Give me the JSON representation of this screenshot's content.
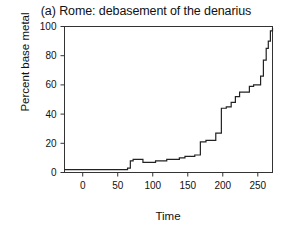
{
  "chart_data": {
    "type": "line",
    "subtype": "step",
    "title": "(a) Rome: debasement of the denarius",
    "xlabel": "Time",
    "ylabel": "Percent base metal",
    "xlim": [
      -26,
      271
    ],
    "ylim": [
      0,
      100
    ],
    "xticks": [
      0,
      50,
      100,
      150,
      200,
      250
    ],
    "yticks": [
      0,
      20,
      40,
      60,
      80,
      100
    ],
    "xtick_labels": [
      "0",
      "50",
      "100",
      "150",
      "200",
      "250"
    ],
    "ytick_labels": [
      "0",
      "20",
      "40",
      "60",
      "80",
      "100"
    ],
    "grid": false,
    "legend": null,
    "line_color": "#222222",
    "series": [
      {
        "name": "Percent base metal in the denarius",
        "x": [
          -26,
          54,
          64,
          68,
          72,
          79,
          86,
          94,
          104,
          112,
          120,
          130,
          138,
          146,
          152,
          160,
          168,
          176,
          186,
          190,
          194,
          198,
          205,
          212,
          218,
          224,
          230,
          238,
          244,
          250,
          254,
          258,
          262,
          265,
          268,
          271
        ],
        "values": [
          2,
          2,
          3,
          8,
          9,
          9,
          7,
          7,
          8,
          8,
          9,
          9,
          10,
          11,
          11,
          12,
          21,
          22,
          22,
          27,
          27,
          44,
          45,
          48,
          52,
          55,
          55,
          59,
          60,
          60,
          66,
          77,
          85,
          90,
          97,
          99
        ]
      }
    ]
  }
}
